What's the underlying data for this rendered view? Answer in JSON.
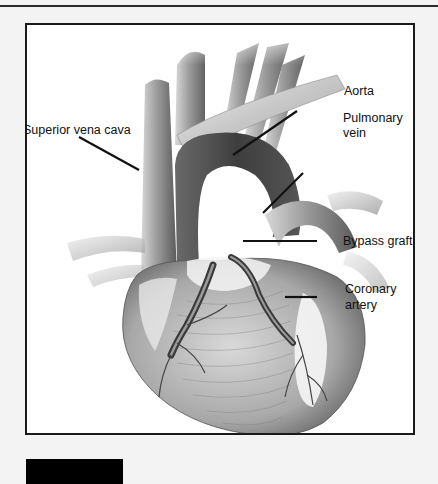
{
  "figure": {
    "labels": {
      "superior_vena_cava": "Superior vena cava",
      "aorta": "Aorta",
      "pulmonary_vein_line1": "Pulmonary",
      "pulmonary_vein_line2": "vein",
      "bypass_graft": "Bypass graft",
      "coronary_artery_line1": "Coronary",
      "coronary_artery_line2": "artery"
    },
    "colors": {
      "background": "#f3f3f3",
      "frame_border": "#1a1a1a",
      "leader_line": "#111111",
      "label_text": "#111111"
    }
  }
}
